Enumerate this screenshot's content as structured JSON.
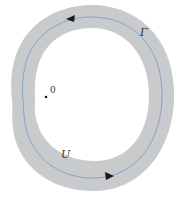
{
  "diagram": {
    "region": {
      "label": "U",
      "fill_color": "#c8cacc"
    },
    "curve": {
      "label": "Γ",
      "stroke_color": "#8aa0cc",
      "arrow_color": "#1a1a1a",
      "orientation": "counterclockwise"
    },
    "point": {
      "label": "0",
      "dot_color": "#1a1a1a"
    }
  }
}
